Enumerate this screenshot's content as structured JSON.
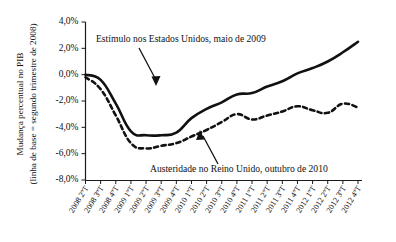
{
  "chart_data": {
    "type": "line",
    "title": "",
    "xlabel": "",
    "ylabel": "Mudança percentual no PIB (linha de base = segundo trimestre de 2008)",
    "ylabel_line1": "Mudança percentual no PIB",
    "ylabel_line2": "(linha de base = segundo trimestre de 2008)",
    "ylim": [
      -8.0,
      4.0
    ],
    "ytick_values": [
      4.0,
      2.0,
      0.0,
      -2.0,
      -4.0,
      -6.0,
      -8.0
    ],
    "ytick_labels": [
      "4,0%",
      "2,0%",
      "0,0%",
      "-2,0%",
      "-4,0%",
      "-6,0%",
      "-8,0%"
    ],
    "grid": false,
    "legend_position": "none",
    "categories": [
      "2008 2ºT",
      "2008 3ºT",
      "2008 4ºT",
      "2009 1ºT",
      "2009 2ºT",
      "2009 3ºT",
      "2009 4ºT",
      "2010 1ºT",
      "2010 2ºT",
      "2010 3ºT",
      "2010 4ºT",
      "2011 1ºT",
      "2011 2ºT",
      "2011 3ºT",
      "2011 4ºT",
      "2012 1ºT",
      "2012 2ºT",
      "2012 3ºT",
      "2012 4ºT"
    ],
    "series": [
      {
        "name": "Estímulo nos Estados Unidos, maio de 2009",
        "style": "solid",
        "values": [
          0.0,
          -0.4,
          -2.2,
          -4.3,
          -4.6,
          -4.6,
          -4.4,
          -3.3,
          -2.6,
          -2.1,
          -1.5,
          -1.4,
          -0.9,
          -0.5,
          0.1,
          0.5,
          1.0,
          1.7,
          2.5
        ]
      },
      {
        "name": "Austeridade no Reino Unido, outubro de 2010",
        "style": "dashed",
        "values": [
          -0.2,
          -1.1,
          -3.1,
          -5.2,
          -5.6,
          -5.4,
          -5.2,
          -4.7,
          -4.2,
          -3.6,
          -3.0,
          -3.4,
          -3.1,
          -2.8,
          -2.4,
          -2.7,
          -2.9,
          -2.2,
          -2.5
        ]
      }
    ],
    "annotations": [
      {
        "id": "annot-stimulus",
        "text": "Estímulo nos Estados Unidos, maio de 2009"
      },
      {
        "id": "annot-austerity",
        "text": "Austeridade no Reino Unido, outubro de 2010"
      }
    ],
    "colors": {
      "line": "#111111",
      "axis": "#1a1a1a",
      "background": "#ffffff"
    }
  }
}
